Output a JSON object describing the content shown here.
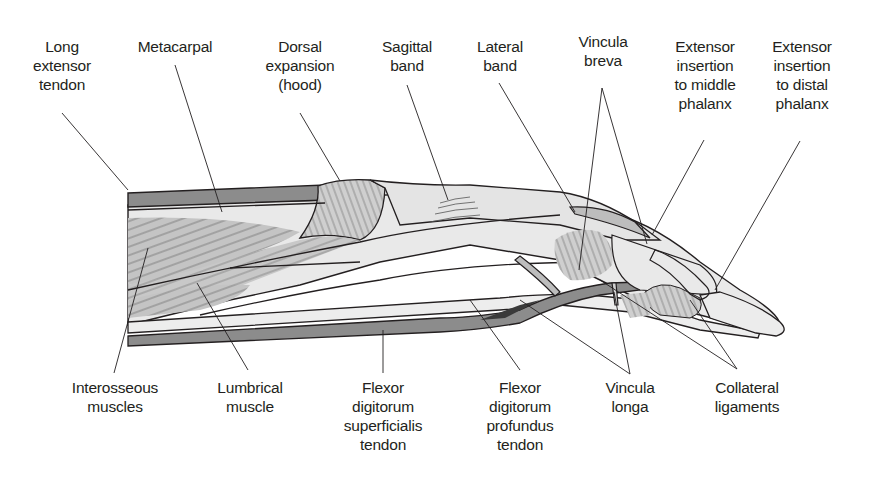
{
  "figure": {
    "colors": {
      "tendon_dark": "#8c8c8c",
      "tissue_light": "#e8e8e8",
      "muscle_mid": "#bdbdbd",
      "outline": "#231f20",
      "background": "#ffffff"
    }
  },
  "labels_top": [
    {
      "id": "long-extensor-tendon",
      "text": "Long\nextensor\ntendon"
    },
    {
      "id": "metacarpal",
      "text": "Metacarpal"
    },
    {
      "id": "dorsal-expansion",
      "text": "Dorsal\nexpansion\n(hood)"
    },
    {
      "id": "sagittal-band",
      "text": "Sagittal\nband"
    },
    {
      "id": "lateral-band",
      "text": "Lateral\nband"
    },
    {
      "id": "vincula-breva",
      "text": "Vincula\nbreva"
    },
    {
      "id": "extensor-insertion-middle",
      "text": "Extensor\ninsertion\nto middle\nphalanx"
    },
    {
      "id": "extensor-insertion-distal",
      "text": "Extensor\ninsertion\nto distal\nphalanx"
    }
  ],
  "labels_bottom": [
    {
      "id": "interosseous-muscles",
      "text": "Interosseous\nmuscles"
    },
    {
      "id": "lumbrical-muscle",
      "text": "Lumbrical\nmuscle"
    },
    {
      "id": "fds-tendon",
      "text": "Flexor\ndigitorum\nsuperficialis\ntendon"
    },
    {
      "id": "fdp-tendon",
      "text": "Flexor\ndigitorum\nprofundus\ntendon"
    },
    {
      "id": "vincula-longa",
      "text": "Vincula\nlonga"
    },
    {
      "id": "collateral-ligaments",
      "text": "Collateral\nligaments"
    }
  ]
}
